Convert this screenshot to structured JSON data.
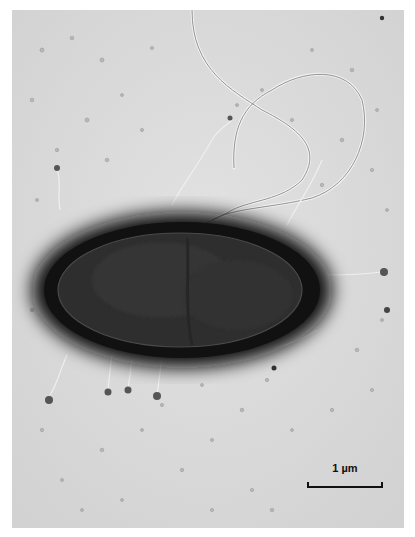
{
  "image": {
    "subject": "transmission electron micrograph of a rod-shaped bacterium with flagella and pili",
    "background_color": "#dcdcdc",
    "cell_halo_color": "#1a1a1a",
    "cell_body_color": "#2b2b2b"
  },
  "scale_bar": {
    "label": "1 µm"
  }
}
